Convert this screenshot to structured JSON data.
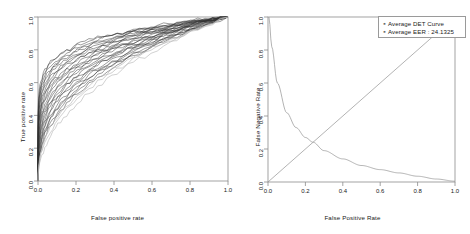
{
  "figure": {
    "width": 470,
    "height": 234,
    "background": "#ffffff",
    "panel_count": 2
  },
  "chart_data": [
    {
      "id": "roc",
      "type": "line",
      "title": "",
      "xlabel": "False positive rate",
      "ylabel": "True positive rate",
      "xlim": [
        0.0,
        1.0
      ],
      "ylim": [
        0.0,
        1.0
      ],
      "xticks": [
        "0.0",
        "0.2",
        "0.4",
        "0.6",
        "0.8",
        "1.0"
      ],
      "yticks": [
        "0.0",
        "0.2",
        "0.4",
        "0.6",
        "0.8",
        "1.0"
      ],
      "xtick_values": [
        0.0,
        0.2,
        0.4,
        0.6,
        0.8,
        1.0
      ],
      "ytick_values": [
        0.0,
        0.2,
        0.4,
        0.6,
        0.8,
        1.0
      ],
      "grid": false,
      "legend": "none",
      "series_count": 28,
      "series_description": "Overlapping ROC curves, one per subject/trial, drawn in dark gray to black",
      "curve_color_dark": "#303030",
      "curve_color_light": "#b4b4b4",
      "curve_shape_exponents": [
        0.118,
        0.125,
        0.133,
        0.141,
        0.149,
        0.158,
        0.167,
        0.176,
        0.186,
        0.196,
        0.206,
        0.217,
        0.228,
        0.24,
        0.252,
        0.264,
        0.277,
        0.29,
        0.304,
        0.318,
        0.333,
        0.348,
        0.364,
        0.381,
        0.398,
        0.416,
        0.44,
        0.475
      ],
      "series": [
        {
          "name": "ROC 1",
          "x": [
            0.0,
            0.05,
            0.1,
            0.2,
            0.3,
            0.4,
            0.6,
            0.8,
            1.0
          ],
          "values": [
            0.0,
            0.74,
            0.81,
            0.88,
            0.91,
            0.94,
            0.97,
            0.99,
            1.0
          ]
        },
        {
          "name": "ROC 14",
          "x": [
            0.0,
            0.05,
            0.1,
            0.2,
            0.3,
            0.4,
            0.6,
            0.8,
            1.0
          ],
          "values": [
            0.0,
            0.58,
            0.68,
            0.78,
            0.84,
            0.88,
            0.93,
            0.97,
            1.0
          ]
        },
        {
          "name": "ROC 28",
          "x": [
            0.0,
            0.05,
            0.1,
            0.2,
            0.3,
            0.4,
            0.6,
            0.8,
            1.0
          ],
          "values": [
            0.0,
            0.35,
            0.46,
            0.58,
            0.67,
            0.73,
            0.84,
            0.93,
            1.0
          ]
        }
      ]
    },
    {
      "id": "det",
      "type": "line",
      "title": "",
      "xlabel": "False Positive Rate",
      "ylabel": "False Negative Rate",
      "xlim": [
        0.0,
        1.0
      ],
      "ylim": [
        0.0,
        1.0
      ],
      "xticks": [
        "0.0",
        "0.2",
        "0.4",
        "0.6",
        "0.8",
        "1.0"
      ],
      "yticks": [
        "0.0",
        "0.2",
        "0.4",
        "0.6",
        "0.8",
        "1.0"
      ],
      "xtick_values": [
        0.0,
        0.2,
        0.4,
        0.6,
        0.8,
        1.0
      ],
      "ytick_values": [
        0.0,
        0.2,
        0.4,
        0.6,
        0.8,
        1.0
      ],
      "grid": false,
      "legend_position": "top-right",
      "eer_point": [
        0.241,
        0.241
      ],
      "curve_color": "#9a9a9a",
      "series": [
        {
          "name": "Average DET Curve",
          "description": "Monotonically decreasing DET curve from (0,1) to (1,0)",
          "x": [
            0.005,
            0.02,
            0.05,
            0.1,
            0.15,
            0.2,
            0.241,
            0.3,
            0.4,
            0.5,
            0.6,
            0.7,
            0.8,
            0.9,
            1.0
          ],
          "values": [
            1.0,
            0.82,
            0.6,
            0.42,
            0.33,
            0.27,
            0.241,
            0.19,
            0.14,
            0.1,
            0.075,
            0.055,
            0.035,
            0.018,
            0.005
          ]
        },
        {
          "name": "Identity / EER line",
          "description": "Diagonal reference line y = x",
          "x": [
            0.0,
            1.0
          ],
          "values": [
            0.0,
            1.0
          ]
        }
      ],
      "legend": {
        "entries": [
          {
            "marker": "square",
            "label": "Average DET Curve"
          },
          {
            "marker": "square",
            "label": "Average EER :  24.1325"
          }
        ]
      }
    }
  ],
  "panels": {
    "roc": {
      "xlabel": "False positive rate",
      "ylabel": "True positive rate",
      "xticks": [
        "0.0",
        "0.2",
        "0.4",
        "0.6",
        "0.8",
        "1.0"
      ],
      "yticks": [
        "0.0",
        "0.2",
        "0.4",
        "0.6",
        "0.8",
        "1.0"
      ]
    },
    "det": {
      "xlabel": "False Positive Rate",
      "ylabel": "False Negative Rate",
      "xticks": [
        "0.0",
        "0.2",
        "0.4",
        "0.6",
        "0.8",
        "1.0"
      ],
      "yticks": [
        "0.0",
        "0.2",
        "0.4",
        "0.6",
        "0.8",
        "1.0"
      ],
      "legend_entry_1": "Average DET Curve",
      "legend_entry_2": "Average EER :  24.1325",
      "legend_marker": "▪"
    }
  }
}
